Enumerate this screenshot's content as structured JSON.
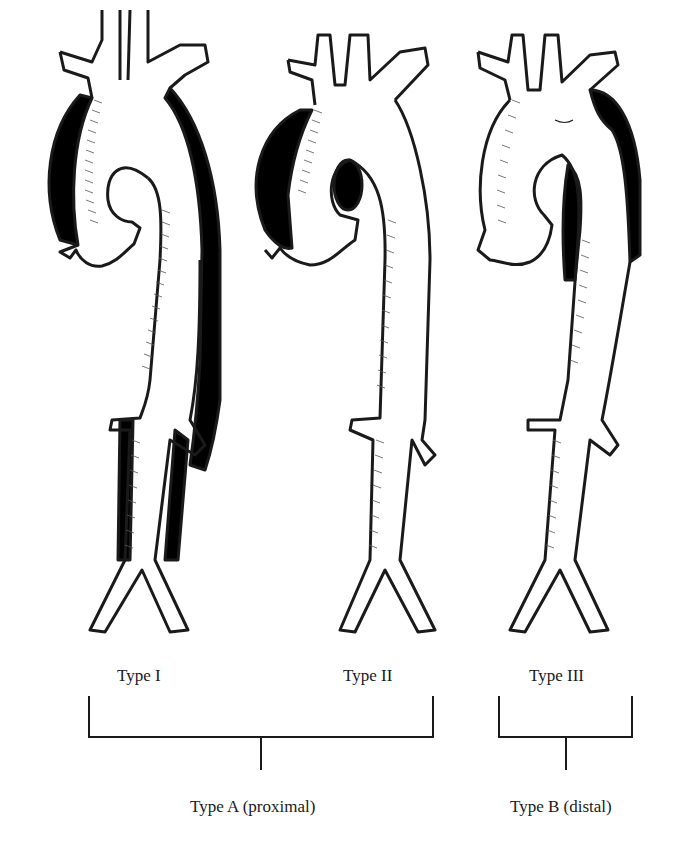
{
  "figure": {
    "panels": [
      {
        "id": "type-1",
        "label": "Type I",
        "false_lumen": "ascending aorta through arch and descending to iliacs",
        "entry_tear": "ascending aorta"
      },
      {
        "id": "type-2",
        "label": "Type II",
        "false_lumen": "ascending aorta only",
        "entry_tear": "ascending aorta"
      },
      {
        "id": "type-3",
        "label": "Type III",
        "false_lumen": "descending thoracic aorta distal to left subclavian",
        "entry_tear": "distal to left subclavian artery"
      }
    ],
    "groups": [
      {
        "id": "group-a",
        "label": "Type A (proximal)",
        "members": [
          "Type I",
          "Type II"
        ]
      },
      {
        "id": "group-b",
        "label": "Type B (distal)",
        "members": [
          "Type III"
        ]
      }
    ],
    "colors": {
      "ink": "#1a1a1a",
      "background": "#ffffff",
      "false_lumen": "#000000"
    }
  }
}
